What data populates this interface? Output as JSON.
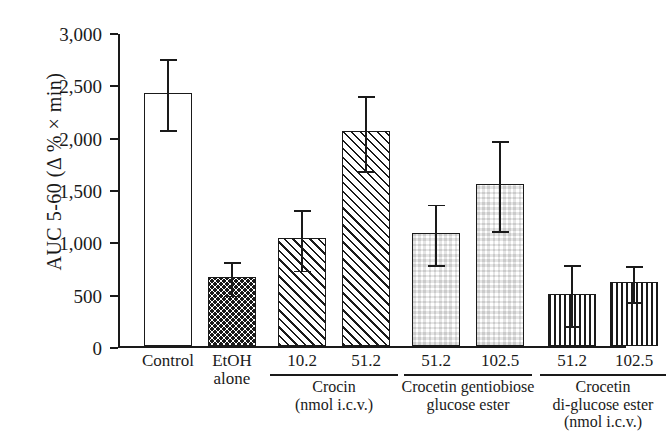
{
  "chart_data": {
    "type": "bar",
    "title": "",
    "xlabel": "",
    "ylabel": "AUC 5-60 (Δ % × min)",
    "ylim": [
      0,
      3000
    ],
    "ytick_values": [
      0,
      500,
      1000,
      1500,
      2000,
      2500,
      3000
    ],
    "ytick_labels": [
      "0",
      "500",
      "1,000",
      "1,500",
      "2,000",
      "2,500",
      "3,000"
    ],
    "grid": false,
    "legend": "none",
    "categories": [
      "Control",
      "EtOH alone",
      "10.2",
      "51.2",
      "51.2",
      "102.5",
      "51.2",
      "102.5"
    ],
    "values": [
      2420,
      660,
      1030,
      2050,
      1080,
      1550,
      500,
      610
    ],
    "errors": [
      340,
      160,
      290,
      360,
      290,
      430,
      290,
      170
    ],
    "bars": [
      {
        "label": "Control",
        "label_line2": "",
        "value": 2420,
        "error": 340,
        "pattern": "plain"
      },
      {
        "label": "EtOH",
        "label_line2": "alone",
        "value": 660,
        "error": 160,
        "pattern": "dots"
      },
      {
        "label": "10.2",
        "label_line2": "",
        "value": 1030,
        "error": 290,
        "pattern": "diagonal"
      },
      {
        "label": "51.2",
        "label_line2": "",
        "value": 2050,
        "error": 360,
        "pattern": "diagonal"
      },
      {
        "label": "51.2",
        "label_line2": "",
        "value": 1080,
        "error": 290,
        "pattern": "checker"
      },
      {
        "label": "102.5",
        "label_line2": "",
        "value": 1550,
        "error": 430,
        "pattern": "checker"
      },
      {
        "label": "51.2",
        "label_line2": "",
        "value": 500,
        "error": 290,
        "pattern": "vertical"
      },
      {
        "label": "102.5",
        "label_line2": "",
        "value": 610,
        "error": 170,
        "pattern": "vertical"
      }
    ],
    "groups": [
      {
        "name": "Crocin",
        "units": "(nmol i.c.v.)",
        "bar_indices": [
          2,
          3
        ]
      },
      {
        "name": "Crocetin gentiobiose",
        "name_line2": "glucose ester",
        "units": "",
        "bar_indices": [
          4,
          5
        ]
      },
      {
        "name": "Crocetin",
        "name_line2": "di-glucose ester",
        "units": "(nmol i.c.v.)",
        "bar_indices": [
          6,
          7
        ]
      }
    ]
  },
  "caption": ""
}
